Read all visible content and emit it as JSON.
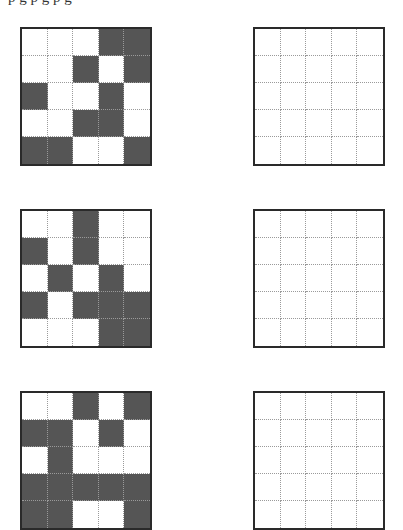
{
  "page": {
    "top_text_fragment": "p  g    p  g    p                                    g"
  },
  "puzzles": [
    {
      "id": 1,
      "pattern_grid": {
        "rows": 5,
        "cols": 5,
        "cells": [
          [
            0,
            0,
            0,
            1,
            1
          ],
          [
            0,
            0,
            1,
            0,
            1
          ],
          [
            1,
            0,
            0,
            1,
            0
          ],
          [
            0,
            0,
            1,
            1,
            0
          ],
          [
            1,
            1,
            0,
            0,
            1
          ]
        ]
      },
      "answer_grid": {
        "rows": 5,
        "cols": 5,
        "cells": [
          [
            0,
            0,
            0,
            0,
            0
          ],
          [
            0,
            0,
            0,
            0,
            0
          ],
          [
            0,
            0,
            0,
            0,
            0
          ],
          [
            0,
            0,
            0,
            0,
            0
          ],
          [
            0,
            0,
            0,
            0,
            0
          ]
        ]
      }
    },
    {
      "id": 2,
      "pattern_grid": {
        "rows": 5,
        "cols": 5,
        "cells": [
          [
            0,
            0,
            1,
            0,
            0
          ],
          [
            1,
            0,
            1,
            0,
            0
          ],
          [
            0,
            1,
            0,
            1,
            0
          ],
          [
            1,
            0,
            1,
            1,
            1
          ],
          [
            0,
            0,
            0,
            1,
            1
          ]
        ]
      },
      "answer_grid": {
        "rows": 5,
        "cols": 5,
        "cells": [
          [
            0,
            0,
            0,
            0,
            0
          ],
          [
            0,
            0,
            0,
            0,
            0
          ],
          [
            0,
            0,
            0,
            0,
            0
          ],
          [
            0,
            0,
            0,
            0,
            0
          ],
          [
            0,
            0,
            0,
            0,
            0
          ]
        ]
      }
    },
    {
      "id": 3,
      "pattern_grid": {
        "rows": 5,
        "cols": 5,
        "cells": [
          [
            0,
            0,
            1,
            0,
            1
          ],
          [
            1,
            1,
            0,
            1,
            0
          ],
          [
            0,
            1,
            0,
            0,
            0
          ],
          [
            1,
            1,
            1,
            1,
            1
          ],
          [
            1,
            1,
            0,
            0,
            1
          ]
        ]
      },
      "answer_grid": {
        "rows": 5,
        "cols": 5,
        "cells": [
          [
            0,
            0,
            0,
            0,
            0
          ],
          [
            0,
            0,
            0,
            0,
            0
          ],
          [
            0,
            0,
            0,
            0,
            0
          ],
          [
            0,
            0,
            0,
            0,
            0
          ],
          [
            0,
            0,
            0,
            0,
            0
          ]
        ]
      }
    }
  ],
  "colors": {
    "filled_cell": "#555555",
    "empty_cell": "#ffffff",
    "grid_border": "#2a2a2a",
    "grid_lines": "#9a9a9a"
  }
}
